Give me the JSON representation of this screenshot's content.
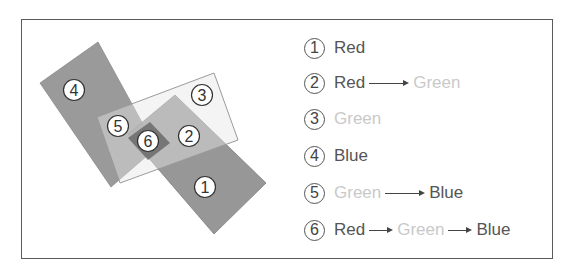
{
  "diagram": {
    "shapes": [
      {
        "id": "4",
        "name": "Blue",
        "fill": "#9a9a9a",
        "points": "40,83 98,42 156,148 111,187"
      },
      {
        "id": "1",
        "name": "Red",
        "fill": "#8e8e8e",
        "points": "128,134 175,95 266,183 214,234"
      },
      {
        "id": "3",
        "name": "Green",
        "fill": "#e2e2e2",
        "points": "97,117 214,73 238,140 120,183"
      },
      {
        "id": "6",
        "name": "Overlap",
        "fill": "#6e6e6e",
        "points": "128,138 150,122 170,143 148,160"
      }
    ],
    "markers": [
      {
        "label": "1",
        "x": 205,
        "y": 187
      },
      {
        "label": "2",
        "x": 189,
        "y": 136
      },
      {
        "label": "3",
        "x": 202,
        "y": 95
      },
      {
        "label": "4",
        "x": 74,
        "y": 90
      },
      {
        "label": "5",
        "x": 118,
        "y": 126
      },
      {
        "label": "6",
        "x": 148,
        "y": 141
      }
    ]
  },
  "legend": {
    "items": [
      {
        "num": "1",
        "parts": [
          {
            "text": "Red",
            "tone": "dark"
          }
        ]
      },
      {
        "num": "2",
        "parts": [
          {
            "text": "Red",
            "tone": "dark"
          },
          {
            "arrow": "long"
          },
          {
            "text": "Green",
            "tone": "light"
          }
        ]
      },
      {
        "num": "3",
        "parts": [
          {
            "text": "Green",
            "tone": "light"
          }
        ]
      },
      {
        "num": "4",
        "parts": [
          {
            "text": "Blue",
            "tone": "dark"
          }
        ]
      },
      {
        "num": "5",
        "parts": [
          {
            "text": "Green",
            "tone": "light"
          },
          {
            "arrow": "long"
          },
          {
            "text": "Blue",
            "tone": "dark"
          }
        ]
      },
      {
        "num": "6",
        "parts": [
          {
            "text": "Red",
            "tone": "dark"
          },
          {
            "arrow": "short"
          },
          {
            "text": "Green",
            "tone": "light"
          },
          {
            "arrow": "short"
          },
          {
            "text": "Blue",
            "tone": "dark"
          }
        ]
      }
    ]
  }
}
